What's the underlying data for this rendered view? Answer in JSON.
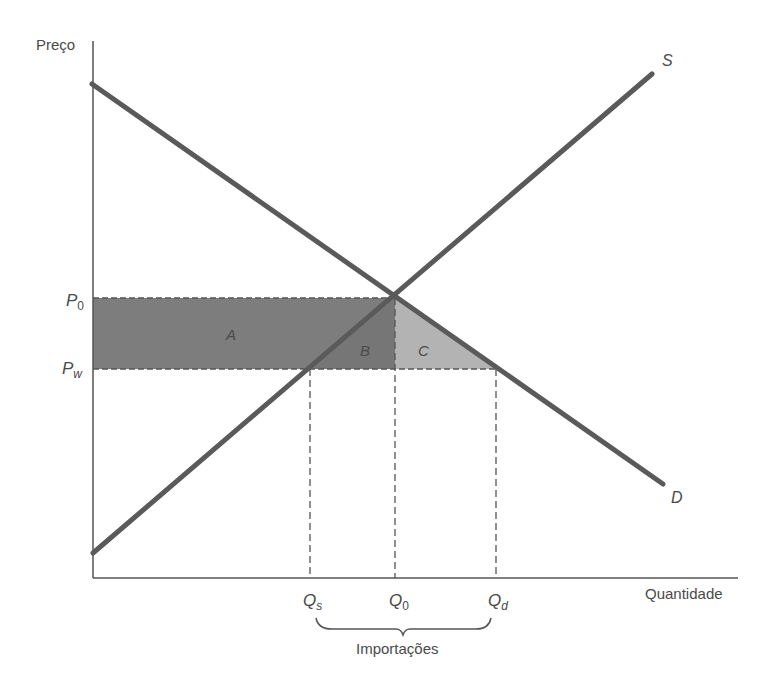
{
  "diagram": {
    "y_axis_label": "Preço",
    "x_axis_label": "Quantidade",
    "curves": [
      {
        "name": "supply",
        "label": "S"
      },
      {
        "name": "demand",
        "label": "D"
      }
    ],
    "price_labels": {
      "p0": {
        "main": "P",
        "sub": "0"
      },
      "pw": {
        "main": "P",
        "sub": "w"
      }
    },
    "quantity_labels": {
      "qs": {
        "main": "Q",
        "sub": "s"
      },
      "q0": {
        "main": "Q",
        "sub": "0"
      },
      "qd": {
        "main": "Q",
        "sub": "d"
      }
    },
    "areas": [
      {
        "label": "A",
        "color": "#7a7a7a"
      },
      {
        "label": "B",
        "color": "#7a7a7a"
      },
      {
        "label": "C",
        "color": "#b4b4b4"
      }
    ],
    "brace_label": "Importações",
    "colors": {
      "axis": "#555555",
      "curve": "#5a5a5a",
      "dark_area": "#7d7d7d",
      "light_area": "#b3b3b3",
      "text": "#4a4a4a"
    }
  }
}
